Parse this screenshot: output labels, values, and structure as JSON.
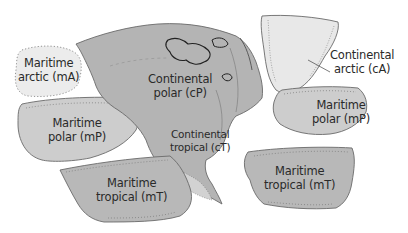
{
  "colors": {
    "land": "#b4b4b4",
    "continental_polar": "#b0b0b0",
    "maritime_arctic": "#ececec",
    "continental_arctic": "#e8e8e8",
    "maritime_polar": "#cdcdcd",
    "maritime_tropical": "#b8b8b8",
    "continental_tropical": "#d2d2d2",
    "outline": "#6a6a6a",
    "text": "#2a2a2a"
  },
  "air_masses": [
    {
      "id": "mA",
      "line1": "Maritime",
      "line2": "arctic (mA)"
    },
    {
      "id": "cP",
      "line1": "Continental",
      "line2": "polar (cP)"
    },
    {
      "id": "cA",
      "line1": "Continental",
      "line2": "arctic (cA)"
    },
    {
      "id": "mP_west",
      "line1": "Maritime",
      "line2": "polar (mP)"
    },
    {
      "id": "mP_east",
      "line1": "Maritime",
      "line2": "polar (mP)"
    },
    {
      "id": "cT",
      "line1": "Continental",
      "line2": "tropical (cT)"
    },
    {
      "id": "mT_west",
      "line1": "Maritime",
      "line2": "tropical (mT)"
    },
    {
      "id": "mT_east",
      "line1": "Maritime",
      "line2": "tropical (mT)"
    }
  ]
}
